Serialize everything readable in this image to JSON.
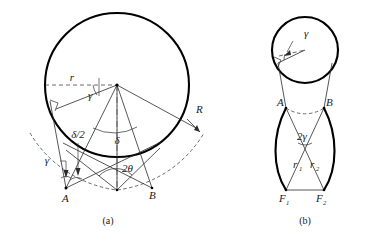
{
  "figure": {
    "type": "geometry-diagram",
    "panels": [
      {
        "id": "a",
        "caption": "(a)",
        "labels": {
          "radius_small": "r",
          "radius_large": "R",
          "gamma_top": "γ",
          "gamma_left": "γ",
          "delta_half": "δ/2",
          "delta": "δ",
          "two_theta": "2θ",
          "point_a": "A",
          "point_b": "B"
        }
      },
      {
        "id": "b",
        "caption": "(b)",
        "labels": {
          "gamma": "γ",
          "two_gamma": "2γ",
          "r1": "r",
          "r1_sub": "1",
          "r2": "r",
          "r2_sub": "2",
          "point_a": "A",
          "point_b": "B",
          "f1": "F",
          "f1_sub": "1",
          "f2": "F",
          "f2_sub": "2"
        }
      }
    ],
    "colors": {
      "ink": "#1a1a1a",
      "stroke": "#2b2b2b",
      "background": "#ffffff"
    }
  }
}
